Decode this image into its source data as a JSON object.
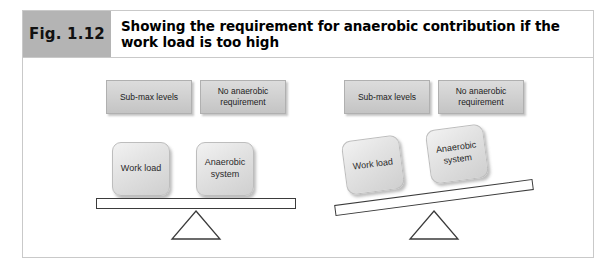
{
  "figure": {
    "number_label": "Fig. 1.12",
    "title": "Showing the requirement for anaerobic contribution if the work load is too high"
  },
  "colors": {
    "fig_number_background": "#b4b4b4",
    "frame_border": "#c9c9c9",
    "flat_box_fill": "#cfcfcf",
    "weight_box_fill": "#e3e3e3",
    "beam_outline": "#3b3b3b",
    "page_background": "#ffffff"
  },
  "diagrams": [
    {
      "id": "balanced-scale",
      "state": "balanced",
      "beam_tilt_degrees": 0,
      "top_labels": [
        {
          "id": "sub-max-levels",
          "text": "Sub-max levels"
        },
        {
          "id": "no-anaerobic-requirement",
          "text": "No anaerobic requirement"
        }
      ],
      "weights": [
        {
          "id": "work-load",
          "text": "Work load"
        },
        {
          "id": "anaerobic-system",
          "text": "Anaerobic system"
        }
      ],
      "fulcrum": "triangle"
    },
    {
      "id": "tilted-scale",
      "state": "tilted-left-down",
      "beam_tilt_degrees": -7.5,
      "top_labels": [
        {
          "id": "sub-max-levels",
          "text": "Sub-max levels"
        },
        {
          "id": "no-anaerobic-requirement",
          "text": "No anaerobic requirement"
        }
      ],
      "weights": [
        {
          "id": "work-load",
          "text": "Work load"
        },
        {
          "id": "anaerobic-system",
          "text": "Anaerobic system"
        }
      ],
      "fulcrum": "triangle"
    }
  ]
}
